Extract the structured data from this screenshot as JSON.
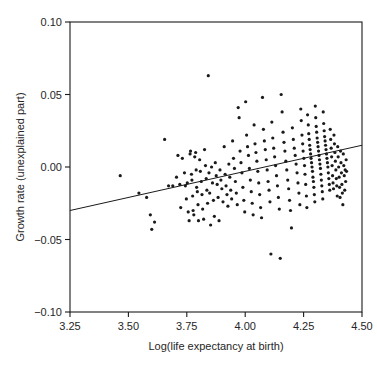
{
  "chart_data": {
    "type": "scatter",
    "title": "",
    "subtitle": "",
    "xlabel": "Log(life expectancy at birth)",
    "ylabel": "Growth rate (unexplained part)",
    "xlim": [
      3.25,
      4.5
    ],
    "ylim": [
      -0.1,
      0.1
    ],
    "xticks": [
      3.25,
      3.5,
      3.75,
      4.0,
      4.25,
      4.5
    ],
    "xtick_labels": [
      "3.25",
      "3.50",
      "3.75",
      "4.00",
      "4.25",
      "4.50"
    ],
    "yticks": [
      -0.1,
      -0.05,
      0.0,
      0.05,
      0.1
    ],
    "ytick_labels": [
      "−0.10",
      "−0.05",
      "0.00",
      "0.05",
      "0.10"
    ],
    "grid": false,
    "legend": null,
    "legend_position": "none",
    "marker": "dot",
    "marker_color": "#1a1a1a",
    "marker_size": 1.6,
    "fit_line": {
      "name": "regression line",
      "color": "#1a1a1a",
      "x_start": 3.25,
      "y_start": -0.03,
      "x_end": 4.5,
      "y_end": 0.015,
      "slope": 0.036,
      "intercept": -0.147
    },
    "n_points": 232,
    "points": [
      [
        3.465,
        -0.006
      ],
      [
        3.545,
        -0.018
      ],
      [
        3.578,
        -0.021
      ],
      [
        3.594,
        -0.033
      ],
      [
        3.6,
        -0.043
      ],
      [
        3.612,
        -0.038
      ],
      [
        3.655,
        0.019
      ],
      [
        3.672,
        -0.013
      ],
      [
        3.69,
        -0.013
      ],
      [
        3.706,
        -0.007
      ],
      [
        3.712,
        0.008
      ],
      [
        3.72,
        -0.012
      ],
      [
        3.724,
        -0.028
      ],
      [
        3.731,
        0.006
      ],
      [
        3.74,
        -0.004
      ],
      [
        3.744,
        -0.013
      ],
      [
        3.748,
        -0.022
      ],
      [
        3.752,
        -0.011
      ],
      [
        3.756,
        -0.031
      ],
      [
        3.76,
        -0.037
      ],
      [
        3.764,
        0.009
      ],
      [
        3.766,
        0.011
      ],
      [
        3.77,
        -0.005
      ],
      [
        3.772,
        -0.009
      ],
      [
        3.775,
        -0.02
      ],
      [
        3.777,
        -0.03
      ],
      [
        3.78,
        -0.033
      ],
      [
        3.784,
        0.007
      ],
      [
        3.788,
        0.01
      ],
      [
        3.79,
        -0.002
      ],
      [
        3.792,
        -0.014
      ],
      [
        3.795,
        -0.017
      ],
      [
        3.798,
        -0.026
      ],
      [
        3.8,
        -0.037
      ],
      [
        3.805,
        0.005
      ],
      [
        3.808,
        -0.003
      ],
      [
        3.812,
        -0.01
      ],
      [
        3.815,
        -0.019
      ],
      [
        3.818,
        -0.029
      ],
      [
        3.822,
        -0.036
      ],
      [
        3.826,
        0.012
      ],
      [
        3.83,
        0.001
      ],
      [
        3.833,
        -0.008
      ],
      [
        3.836,
        -0.016
      ],
      [
        3.839,
        -0.025
      ],
      [
        3.842,
        0.063
      ],
      [
        3.845,
        -0.004
      ],
      [
        3.848,
        -0.018
      ],
      [
        3.852,
        -0.04
      ],
      [
        3.856,
        0.0
      ],
      [
        3.86,
        -0.011
      ],
      [
        3.864,
        -0.023
      ],
      [
        3.868,
        -0.034
      ],
      [
        3.872,
        0.003
      ],
      [
        3.876,
        -0.006
      ],
      [
        3.88,
        -0.012
      ],
      [
        3.884,
        -0.021
      ],
      [
        3.888,
        -0.037
      ],
      [
        3.892,
        -0.002
      ],
      [
        3.896,
        -0.009
      ],
      [
        3.9,
        -0.015
      ],
      [
        3.905,
        -0.024
      ],
      [
        3.91,
        0.014
      ],
      [
        3.914,
        -0.005
      ],
      [
        3.918,
        -0.013
      ],
      [
        3.922,
        -0.019
      ],
      [
        3.926,
        -0.027
      ],
      [
        3.93,
        0.002
      ],
      [
        3.934,
        -0.007
      ],
      [
        3.938,
        -0.016
      ],
      [
        3.942,
        -0.022
      ],
      [
        3.946,
        0.018
      ],
      [
        3.95,
        0.006
      ],
      [
        3.954,
        -0.001
      ],
      [
        3.958,
        -0.01
      ],
      [
        3.962,
        -0.018
      ],
      [
        3.966,
        -0.026
      ],
      [
        3.97,
        0.041
      ],
      [
        3.974,
        0.034
      ],
      [
        3.978,
        0.011
      ],
      [
        3.982,
        0.003
      ],
      [
        3.986,
        -0.004
      ],
      [
        3.99,
        -0.014
      ],
      [
        3.994,
        -0.023
      ],
      [
        3.998,
        -0.031
      ],
      [
        4.002,
        0.045
      ],
      [
        4.006,
        0.022
      ],
      [
        4.01,
        0.014
      ],
      [
        4.014,
        0.008
      ],
      [
        4.018,
        -0.001
      ],
      [
        4.022,
        -0.009
      ],
      [
        4.026,
        -0.017
      ],
      [
        4.03,
        -0.025
      ],
      [
        4.034,
        -0.033
      ],
      [
        4.038,
        0.029
      ],
      [
        4.042,
        0.016
      ],
      [
        4.046,
        0.01
      ],
      [
        4.05,
        0.004
      ],
      [
        4.054,
        -0.003
      ],
      [
        4.058,
        -0.011
      ],
      [
        4.062,
        -0.019
      ],
      [
        4.066,
        -0.028
      ],
      [
        4.07,
        -0.035
      ],
      [
        4.074,
        0.048
      ],
      [
        4.078,
        0.026
      ],
      [
        4.082,
        0.018
      ],
      [
        4.086,
        0.012
      ],
      [
        4.09,
        0.005
      ],
      [
        4.094,
        -0.002
      ],
      [
        4.098,
        -0.01
      ],
      [
        4.102,
        -0.016
      ],
      [
        4.106,
        -0.024
      ],
      [
        4.11,
        -0.06
      ],
      [
        4.114,
        0.031
      ],
      [
        4.118,
        0.02
      ],
      [
        4.122,
        0.013
      ],
      [
        4.126,
        0.007
      ],
      [
        4.13,
        0.001
      ],
      [
        4.134,
        -0.006
      ],
      [
        4.138,
        -0.013
      ],
      [
        4.142,
        -0.021
      ],
      [
        4.146,
        -0.029
      ],
      [
        4.15,
        -0.063
      ],
      [
        4.154,
        0.05
      ],
      [
        4.158,
        0.038
      ],
      [
        4.162,
        0.024
      ],
      [
        4.166,
        0.017
      ],
      [
        4.17,
        0.011
      ],
      [
        4.174,
        0.004
      ],
      [
        4.178,
        -0.002
      ],
      [
        4.182,
        -0.009
      ],
      [
        4.186,
        -0.015
      ],
      [
        4.19,
        -0.023
      ],
      [
        4.194,
        -0.03
      ],
      [
        4.198,
        -0.042
      ],
      [
        4.202,
        0.027
      ],
      [
        4.206,
        0.019
      ],
      [
        4.21,
        0.013
      ],
      [
        4.214,
        0.008
      ],
      [
        4.218,
        0.002
      ],
      [
        4.222,
        -0.004
      ],
      [
        4.226,
        -0.011
      ],
      [
        4.23,
        -0.018
      ],
      [
        4.234,
        -0.026
      ],
      [
        4.238,
        0.04
      ],
      [
        4.24,
        0.032
      ],
      [
        4.243,
        0.022
      ],
      [
        4.246,
        0.016
      ],
      [
        4.248,
        0.011
      ],
      [
        4.251,
        0.006
      ],
      [
        4.254,
        0.001
      ],
      [
        4.256,
        -0.005
      ],
      [
        4.259,
        -0.012
      ],
      [
        4.262,
        -0.02
      ],
      [
        4.264,
        -0.028
      ],
      [
        4.267,
        0.036
      ],
      [
        4.27,
        0.029
      ],
      [
        4.272,
        0.023
      ],
      [
        4.274,
        0.019
      ],
      [
        4.276,
        0.015
      ],
      [
        4.278,
        0.012
      ],
      [
        4.28,
        0.009
      ],
      [
        4.282,
        0.006
      ],
      [
        4.284,
        0.003
      ],
      [
        4.286,
        0.0
      ],
      [
        4.288,
        -0.003
      ],
      [
        4.29,
        -0.007
      ],
      [
        4.292,
        -0.01
      ],
      [
        4.294,
        -0.014
      ],
      [
        4.296,
        -0.019
      ],
      [
        4.298,
        -0.024
      ],
      [
        4.3,
        0.042
      ],
      [
        4.302,
        0.034
      ],
      [
        4.304,
        0.028
      ],
      [
        4.306,
        0.024
      ],
      [
        4.308,
        0.02
      ],
      [
        4.31,
        0.017
      ],
      [
        4.312,
        0.014
      ],
      [
        4.314,
        0.011
      ],
      [
        4.316,
        0.008
      ],
      [
        4.318,
        0.005
      ],
      [
        4.32,
        0.002
      ],
      [
        4.322,
        -0.001
      ],
      [
        4.324,
        -0.005
      ],
      [
        4.326,
        -0.009
      ],
      [
        4.328,
        -0.013
      ],
      [
        4.33,
        -0.017
      ],
      [
        4.332,
        -0.022
      ],
      [
        4.334,
        0.038
      ],
      [
        4.336,
        0.03
      ],
      [
        4.338,
        0.025
      ],
      [
        4.34,
        0.021
      ],
      [
        4.342,
        0.018
      ],
      [
        4.344,
        0.015
      ],
      [
        4.346,
        0.012
      ],
      [
        4.348,
        0.009
      ],
      [
        4.35,
        0.006
      ],
      [
        4.352,
        0.003
      ],
      [
        4.354,
        0.0
      ],
      [
        4.356,
        -0.004
      ],
      [
        4.358,
        -0.008
      ],
      [
        4.36,
        -0.012
      ],
      [
        4.362,
        -0.016
      ],
      [
        4.364,
        0.026
      ],
      [
        4.366,
        0.019
      ],
      [
        4.368,
        0.013
      ],
      [
        4.37,
        0.007
      ],
      [
        4.372,
        0.001
      ],
      [
        4.374,
        -0.006
      ],
      [
        4.376,
        -0.011
      ],
      [
        4.378,
        -0.015
      ],
      [
        4.38,
        0.022
      ],
      [
        4.382,
        0.016
      ],
      [
        4.384,
        0.01
      ],
      [
        4.386,
        0.004
      ],
      [
        4.388,
        -0.002
      ],
      [
        4.39,
        -0.008
      ],
      [
        4.392,
        -0.013
      ],
      [
        4.394,
        -0.02
      ],
      [
        4.396,
        0.014
      ],
      [
        4.398,
        0.007
      ],
      [
        4.4,
        0.0
      ],
      [
        4.402,
        -0.007
      ],
      [
        4.404,
        -0.014
      ],
      [
        4.406,
        -0.021
      ],
      [
        4.408,
        0.011
      ],
      [
        4.41,
        0.003
      ],
      [
        4.412,
        -0.004
      ],
      [
        4.414,
        -0.012
      ],
      [
        4.416,
        -0.018
      ],
      [
        4.418,
        -0.026
      ],
      [
        4.42,
        0.009
      ],
      [
        4.422,
        0.001
      ],
      [
        4.424,
        -0.006
      ],
      [
        4.426,
        -0.016
      ],
      [
        4.428,
        -0.002
      ],
      [
        4.43,
        -0.01
      ],
      [
        4.432,
        0.005
      ],
      [
        4.434,
        -0.003
      ]
    ]
  }
}
